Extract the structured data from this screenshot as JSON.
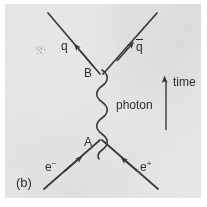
{
  "figure": {
    "caption": "(b)",
    "background_color": "#e9e7e5",
    "ink_color": "#2f2f2f",
    "page_color": "#ffffff"
  },
  "labels": {
    "vertex_upper": "B",
    "vertex_lower": "A",
    "quark": "q",
    "antiquark": "q",
    "antiquark_bar": "overline",
    "photon": "photon",
    "electron": "e",
    "electron_charge": "−",
    "positron": "e",
    "positron_charge": "+",
    "time_axis": "time"
  },
  "diagram": {
    "type": "feynman",
    "vertices": [
      {
        "name": "A",
        "x": 100,
        "y": 140,
        "label": "A"
      },
      {
        "name": "B",
        "x": 100,
        "y": 70,
        "label": "B"
      }
    ],
    "propagator": {
      "name": "photon",
      "style": "wavy",
      "from": "A",
      "to": "B",
      "label": "photon"
    },
    "legs": [
      {
        "name": "electron-in",
        "label": "e−",
        "from": [
          44,
          188
        ],
        "to": [
          100,
          140
        ],
        "arrow_at": [
          76,
          159
        ],
        "arrow_direction": "up-right"
      },
      {
        "name": "positron-in",
        "label": "e+",
        "from": [
          158,
          188
        ],
        "to": [
          100,
          140
        ],
        "arrow_at": [
          124,
          160
        ],
        "arrow_direction": "up-left"
      },
      {
        "name": "quark-out",
        "label": "q",
        "from": [
          100,
          70
        ],
        "to": [
          48,
          13
        ],
        "arrow_at": [
          76,
          43
        ],
        "arrow_direction": "up-left"
      },
      {
        "name": "antiquark-out",
        "label": "q̄",
        "from": [
          100,
          70
        ],
        "to": [
          156,
          13
        ],
        "arrow_at": [
          130,
          42
        ],
        "arrow_direction": "up-right"
      }
    ],
    "time_arrow": {
      "label": "time",
      "direction": "up",
      "from": [
        166,
        130
      ],
      "to": [
        166,
        78
      ]
    }
  }
}
